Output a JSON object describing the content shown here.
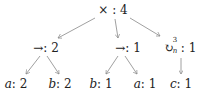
{
  "tree": {
    "root": {
      "op": "×",
      "count": "4",
      "x": 113,
      "y": 10
    },
    "level1": [
      {
        "op": "→",
        "count": "2",
        "x": 46,
        "y": 48
      },
      {
        "op": "→",
        "count": "1",
        "x": 128,
        "y": 48
      },
      {
        "op": "↻",
        "op_sup": "3",
        "op_sub": "n",
        "count": "1",
        "x": 181,
        "y": 48
      }
    ],
    "level2": [
      {
        "var": "a",
        "count": "2",
        "x": 16,
        "y": 84
      },
      {
        "var": "b",
        "count": "2",
        "x": 60,
        "y": 84
      },
      {
        "var": "b",
        "count": "1",
        "x": 101,
        "y": 84
      },
      {
        "var": "a",
        "count": "1",
        "x": 145,
        "y": 84
      },
      {
        "var": "c",
        "count": "1",
        "x": 181,
        "y": 84
      }
    ]
  },
  "edge_color": "#888888"
}
